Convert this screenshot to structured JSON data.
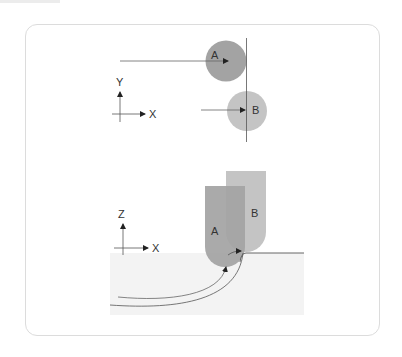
{
  "top_view": {
    "axis_vertical_label": "Y",
    "axis_horizontal_label": "X",
    "tool_a_label": "A",
    "tool_b_label": "B"
  },
  "side_view": {
    "axis_vertical_label": "Z",
    "axis_horizontal_label": "X",
    "tool_a_label": "A",
    "tool_b_label": "B"
  },
  "colors": {
    "tool_a": "#a3a3a3",
    "tool_b": "#c4c4c4",
    "workpiece": "#f2f2f2",
    "line": "#555555"
  }
}
